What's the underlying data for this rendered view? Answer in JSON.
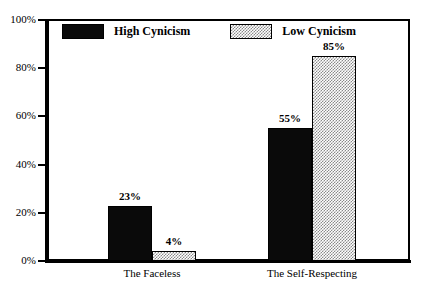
{
  "chart_data": {
    "type": "bar",
    "title": "",
    "xlabel": "",
    "ylabel": "",
    "ylim": [
      0,
      100
    ],
    "ytick_labels": [
      "0%",
      "20%",
      "40%",
      "60%",
      "80%",
      "100%"
    ],
    "ytick_values": [
      0,
      20,
      40,
      60,
      80,
      100
    ],
    "grid": false,
    "legend_position": "top-left-inside",
    "categories": [
      "The Faceless",
      "The Self-Respecting"
    ],
    "series": [
      {
        "name": "High Cynicism",
        "fill": "solid-black",
        "color": "#0a0a0a",
        "values": [
          23,
          55
        ],
        "labels": [
          "23%",
          "55%"
        ]
      },
      {
        "name": "Low Cynicism",
        "fill": "checkered-gray",
        "color": "#8a8a8a",
        "values": [
          4,
          85
        ],
        "labels": [
          "4%",
          "85%"
        ]
      }
    ]
  },
  "frame": {
    "border_color": "#000000",
    "background": "#ffffff"
  }
}
